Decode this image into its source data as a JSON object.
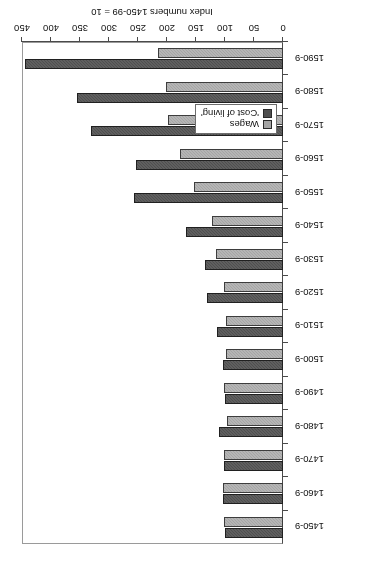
{
  "chart_data": {
    "type": "bar",
    "orientation": "horizontal",
    "title": "",
    "subtitle": "",
    "xlabel": "Index numbers 1450-99 = 10",
    "ylabel": "",
    "xlim": [
      0,
      450
    ],
    "xticks": [
      0,
      50,
      100,
      150,
      200,
      250,
      300,
      350,
      400,
      450
    ],
    "xtick_labels": [
      "0",
      "50",
      "100",
      "150",
      "200",
      "250",
      "300",
      "350",
      "400",
      "450"
    ],
    "grid": false,
    "legend_position": "bottom-left",
    "rotated_180": true,
    "categories": [
      "1450-9",
      "1460-9",
      "1470-9",
      "1480-9",
      "1490-9",
      "1500-9",
      "1510-9",
      "1520-9",
      "1530-9",
      "1540-9",
      "1550-9",
      "1560-9",
      "1570-9",
      "1580-9",
      "1590-9"
    ],
    "series": [
      {
        "name": "Wages",
        "color": "#a5a5a5",
        "values": [
          102,
          103,
          101,
          96,
          101,
          99,
          98,
          102,
          116,
          123,
          153,
          178,
          199,
          202,
          216
        ]
      },
      {
        "name": "'Cost of living'",
        "color": "#4f4f4f",
        "values": [
          100,
          103,
          102,
          110,
          100,
          104,
          114,
          131,
          134,
          167,
          257,
          254,
          331,
          355,
          444
        ]
      }
    ],
    "legend": [
      {
        "label": "Wages",
        "color": "#a5a5a5"
      },
      {
        "label": "'Cost of living'",
        "color": "#4f4f4f"
      }
    ]
  }
}
